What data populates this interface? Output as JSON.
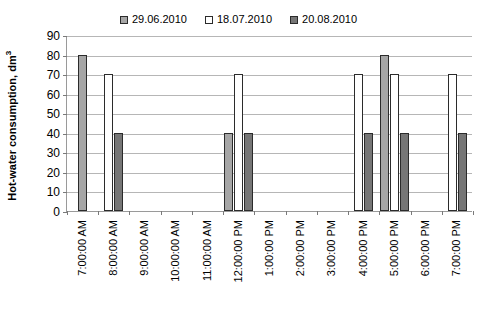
{
  "chart_data": {
    "type": "bar",
    "title": "",
    "xlabel": "",
    "ylabel": "Hot-water consumption, dm3",
    "ylabel_base": "Hot-water consumption, dm",
    "ylabel_sup": "3",
    "ylim": [
      0,
      90
    ],
    "ytick_step": 10,
    "yticks": [
      90,
      80,
      70,
      60,
      50,
      40,
      30,
      20,
      10,
      0
    ],
    "grid": true,
    "legend_position": "top-center",
    "categories": [
      "7:00:00 AM",
      "8:00:00 AM",
      "9:00:00 AM",
      "10:00:00 AM",
      "11:00:00 AM",
      "12:00:00 PM",
      "1:00:00 PM",
      "2:00:00 PM",
      "3:00:00 PM",
      "4:00:00 PM",
      "5:00:00 PM",
      "6:00:00 PM",
      "7:00:00 PM"
    ],
    "series": [
      {
        "name": "29.06.2010",
        "color": "#a6a6a6",
        "border": "#2b2b2b",
        "values": [
          80,
          0,
          0,
          0,
          0,
          40,
          0,
          0,
          0,
          0,
          80,
          0,
          0
        ]
      },
      {
        "name": "18.07.2010",
        "color": "#ffffff",
        "border": "#2b2b2b",
        "values": [
          0,
          70,
          0,
          0,
          0,
          70,
          0,
          0,
          0,
          70,
          70,
          0,
          70
        ]
      },
      {
        "name": "20.08.2010",
        "color": "#767676",
        "border": "#2b2b2b",
        "values": [
          0,
          40,
          0,
          0,
          0,
          40,
          0,
          0,
          0,
          40,
          40,
          0,
          40
        ]
      }
    ]
  }
}
